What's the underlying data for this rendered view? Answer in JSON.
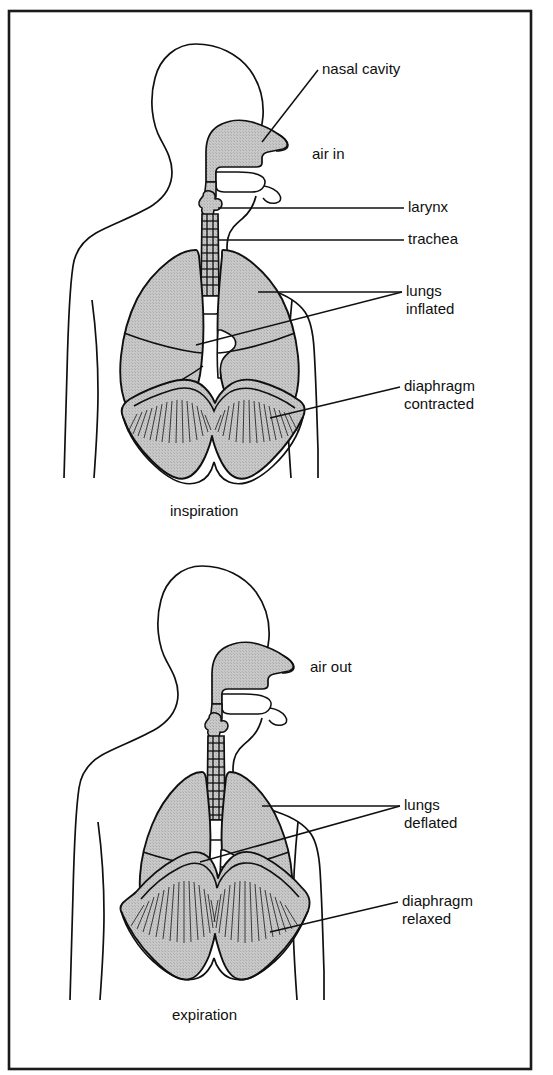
{
  "figure": {
    "frame_color": "#1a1a1a",
    "background_color": "#ffffff",
    "organ_fill_color": "#c2c2c2",
    "outline_color": "#101010",
    "leader_line_color": "#101010"
  },
  "panels": [
    {
      "id": "inspiration",
      "caption": "inspiration",
      "labels": [
        {
          "key": "nasal_cavity",
          "text": "nasal cavity"
        },
        {
          "key": "air_in",
          "text": "air in"
        },
        {
          "key": "larynx",
          "text": "larynx"
        },
        {
          "key": "trachea",
          "text": "trachea"
        },
        {
          "key": "lungs_line1",
          "text": "lungs"
        },
        {
          "key": "lungs_line2",
          "text": "inflated"
        },
        {
          "key": "diaphragm_line1",
          "text": "diaphragm"
        },
        {
          "key": "diaphragm_line2",
          "text": "contracted"
        }
      ]
    },
    {
      "id": "expiration",
      "caption": "expiration",
      "labels": [
        {
          "key": "air_out",
          "text": "air out"
        },
        {
          "key": "lungs_line1",
          "text": "lungs"
        },
        {
          "key": "lungs_line2",
          "text": "deflated"
        },
        {
          "key": "diaphragm_line1",
          "text": "diaphragm"
        },
        {
          "key": "diaphragm_line2",
          "text": "relaxed"
        }
      ]
    }
  ]
}
